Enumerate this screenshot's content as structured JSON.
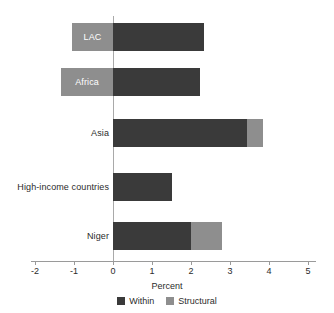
{
  "chart_data": {
    "type": "bar",
    "orientation": "horizontal",
    "stacked": true,
    "title": "",
    "xlabel": "Percent",
    "ylabel": "",
    "xlim": [
      -2,
      5
    ],
    "xticks": [
      "-2",
      "-1",
      "0",
      "1",
      "2",
      "3",
      "4",
      "5"
    ],
    "xtick_values": [
      -2,
      -1,
      0,
      1,
      2,
      3,
      4,
      5
    ],
    "grid": false,
    "legend_position": "bottom-center",
    "categories": [
      "LAC",
      "Africa",
      "Asia",
      "High-income countries",
      "Niger"
    ],
    "series": [
      {
        "name": "Within",
        "color": "#3a3a3a",
        "values": [
          2.33,
          2.23,
          3.44,
          1.51,
          2.0
        ]
      },
      {
        "name": "Structural",
        "color": "#8e8e8e",
        "values": [
          -1.05,
          -1.33,
          0.41,
          0.0,
          0.8
        ]
      }
    ],
    "bars": [
      {
        "category": "LAC",
        "label_placement": "inside-structural",
        "within_start": 0.0,
        "within_end": 2.33,
        "structural_start": -1.05,
        "structural_end": 0.0
      },
      {
        "category": "Africa",
        "label_placement": "inside-structural",
        "within_start": 0.0,
        "within_end": 2.23,
        "structural_start": -1.33,
        "structural_end": 0.0
      },
      {
        "category": "Asia",
        "label_placement": "outside-left",
        "within_start": 0.0,
        "within_end": 3.44,
        "structural_start": 3.44,
        "structural_end": 3.85
      },
      {
        "category": "High-income countries",
        "label_placement": "outside-left",
        "within_start": 0.0,
        "within_end": 1.51,
        "structural_start": 0.0,
        "structural_end": 0.0
      },
      {
        "category": "Niger",
        "label_placement": "outside-left",
        "within_start": 0.0,
        "within_end": 2.0,
        "structural_start": 2.0,
        "structural_end": 2.8
      }
    ]
  },
  "axis": {
    "x_title": "Percent",
    "tick_0": "-2",
    "tick_1": "-1",
    "tick_2": "0",
    "tick_3": "1",
    "tick_4": "2",
    "tick_5": "3",
    "tick_6": "4",
    "tick_7": "5"
  },
  "labels": {
    "lac": "LAC",
    "africa": "Africa",
    "asia": "Asia",
    "high_income": "High-income countries",
    "niger": "Niger"
  },
  "legend": {
    "within": "Within",
    "structural": "Structural"
  },
  "colors": {
    "within": "#3a3a3a",
    "structural": "#8e8e8e",
    "axis": "#9a9a9a",
    "background": "#ffffff"
  }
}
